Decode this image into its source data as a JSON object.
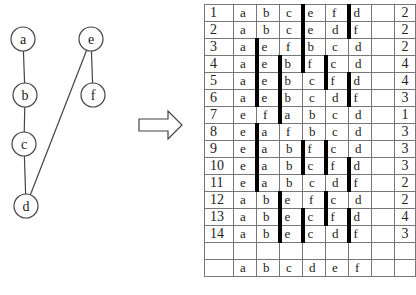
{
  "graph": {
    "nodes": [
      {
        "id": "a",
        "label": "a",
        "x": 23,
        "y": 39
      },
      {
        "id": "b",
        "label": "b",
        "x": 25,
        "y": 95
      },
      {
        "id": "c",
        "label": "c",
        "x": 24,
        "y": 144
      },
      {
        "id": "d",
        "label": "d",
        "x": 26,
        "y": 206
      },
      {
        "id": "e",
        "label": "e",
        "x": 91,
        "y": 39
      },
      {
        "id": "f",
        "label": "f",
        "x": 93,
        "y": 95
      }
    ],
    "edges": [
      [
        "a",
        "b"
      ],
      [
        "b",
        "c"
      ],
      [
        "c",
        "d"
      ],
      [
        "e",
        "f"
      ],
      [
        "e",
        "d"
      ]
    ]
  },
  "arrow": {
    "direction": "right"
  },
  "table": {
    "rows": [
      {
        "index": "1",
        "cells": [
          "a",
          "b",
          "c",
          "e",
          "f",
          "d"
        ],
        "bars": [
          4,
          6
        ],
        "count": "2"
      },
      {
        "index": "2",
        "cells": [
          "a",
          "b",
          "c",
          "e",
          "d",
          "f"
        ],
        "bars": [
          4,
          6
        ],
        "count": "2"
      },
      {
        "index": "3",
        "cells": [
          "a",
          "e",
          "f",
          "b",
          "c",
          "d"
        ],
        "bars": [
          2,
          4
        ],
        "count": "2"
      },
      {
        "index": "4",
        "cells": [
          "a",
          "e",
          "b",
          "f",
          "c",
          "d"
        ],
        "bars": [
          2,
          3,
          4,
          5
        ],
        "count": "4"
      },
      {
        "index": "5",
        "cells": [
          "a",
          "e",
          "b",
          "c",
          "f",
          "d"
        ],
        "bars": [
          2,
          3,
          5,
          6
        ],
        "count": "4"
      },
      {
        "index": "6",
        "cells": [
          "a",
          "e",
          "b",
          "c",
          "d",
          "f"
        ],
        "bars": [
          2,
          3,
          6
        ],
        "count": "3"
      },
      {
        "index": "7",
        "cells": [
          "e",
          "f",
          "a",
          "b",
          "c",
          "d"
        ],
        "bars": [
          3
        ],
        "count": "1"
      },
      {
        "index": "8",
        "cells": [
          "e",
          "a",
          "f",
          "b",
          "c",
          "d"
        ],
        "bars": [
          2
        ],
        "count": "3"
      },
      {
        "index": "9",
        "cells": [
          "e",
          "a",
          "b",
          "f",
          "c",
          "d"
        ],
        "bars": [
          2,
          4,
          5
        ],
        "count": "3"
      },
      {
        "index": "10",
        "cells": [
          "e",
          "a",
          "b",
          "c",
          "f",
          "d"
        ],
        "bars": [
          2,
          4,
          5,
          6
        ],
        "count": "3"
      },
      {
        "index": "11",
        "cells": [
          "e",
          "a",
          "b",
          "c",
          "d",
          "f"
        ],
        "bars": [
          2,
          6
        ],
        "count": "2"
      },
      {
        "index": "12",
        "cells": [
          "a",
          "b",
          "e",
          "f",
          "c",
          "d"
        ],
        "bars": [
          3,
          5
        ],
        "count": "2"
      },
      {
        "index": "13",
        "cells": [
          "a",
          "b",
          "e",
          "c",
          "f",
          "d"
        ],
        "bars": [
          3,
          4,
          5,
          6
        ],
        "count": "4"
      },
      {
        "index": "14",
        "cells": [
          "a",
          "b",
          "e",
          "c",
          "d",
          "f"
        ],
        "bars": [
          3,
          4,
          6
        ],
        "count": "3"
      },
      {
        "index": "",
        "cells": [
          "",
          "",
          "",
          "",
          "",
          ""
        ],
        "bars": [],
        "count": ""
      },
      {
        "index": "",
        "cells": [
          "a",
          "b",
          "c",
          "d",
          "e",
          "f"
        ],
        "bars": [],
        "count": ""
      }
    ]
  }
}
